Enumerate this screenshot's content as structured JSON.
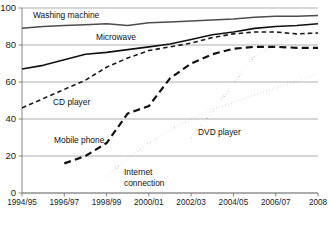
{
  "chart_data": {
    "type": "line",
    "title": "",
    "xlabel": "",
    "ylabel": "",
    "ylim": [
      0,
      100
    ],
    "yticks": [
      0,
      20,
      40,
      60,
      80,
      100
    ],
    "grid": true,
    "legend": "inline-labels",
    "categories": [
      "1994/95",
      "1995/96",
      "1996/97",
      "1997/98",
      "1998/99",
      "1999/00",
      "2000/01",
      "2001/02",
      "2002/03",
      "2003/04",
      "2004/05",
      "2005/06",
      "2006/07",
      "2007/08",
      "2008"
    ],
    "xticklabels": [
      "1994/95",
      "1996/97",
      "1998/99",
      "2000/01",
      "2002/03",
      "2004/05",
      "2006/07",
      "2008"
    ],
    "series": [
      {
        "name": "Washing machine",
        "style": "solid",
        "color": "#4d4d4d",
        "width": 1.5,
        "label_x": 33,
        "label_y": 16,
        "x": [
          "1994/95",
          "1995/96",
          "1996/97",
          "1997/98",
          "1998/99",
          "1999/00",
          "2000/01",
          "2001/02",
          "2002/03",
          "2003/04",
          "2004/05",
          "2005/06",
          "2006/07",
          "2007/08",
          "2008"
        ],
        "values": [
          89,
          90,
          90.5,
          91,
          91.5,
          90.5,
          92,
          92.5,
          93,
          93.5,
          94,
          95,
          95.5,
          95.5,
          96
        ]
      },
      {
        "name": "Microwave",
        "style": "solid",
        "color": "#111111",
        "width": 1.6,
        "label_x": 96,
        "label_y": 38,
        "x": [
          "1994/95",
          "1995/96",
          "1996/97",
          "1997/98",
          "1998/99",
          "1999/00",
          "2000/01",
          "2001/02",
          "2002/03",
          "2003/04",
          "2004/05",
          "2005/06",
          "2006/07",
          "2007/08",
          "2008"
        ],
        "values": [
          67,
          69,
          72,
          75,
          76,
          77.5,
          79,
          80.5,
          83,
          85.5,
          87,
          89,
          90,
          90.5,
          91.5
        ]
      },
      {
        "name": "CD player",
        "style": "dashed",
        "color": "#1a1a1a",
        "width": 1.6,
        "label_x": 53,
        "label_y": 103,
        "x": [
          "1994/95",
          "1995/96",
          "1996/97",
          "1997/98",
          "1998/99",
          "1999/00",
          "2000/01",
          "2001/02",
          "2002/03",
          "2003/04",
          "2004/05",
          "2005/06",
          "2006/07",
          "2007/08",
          "2008"
        ],
        "values": [
          46,
          51,
          56,
          61,
          68,
          73,
          77,
          79,
          81,
          84,
          86,
          87,
          87,
          86,
          86.5
        ]
      },
      {
        "name": "Mobile phone",
        "style": "longdash",
        "color": "#111111",
        "width": 2.2,
        "label_x": 54,
        "label_y": 141,
        "x": [
          "1996/97",
          "1997/98",
          "1998/99",
          "1999/00",
          "2000/01",
          "2001/02",
          "2002/03",
          "2003/04",
          "2004/05",
          "2005/06",
          "2006/07",
          "2007/08",
          "2008"
        ],
        "values": [
          16,
          20,
          27,
          43,
          47,
          62,
          70,
          75,
          78,
          79,
          79,
          78.5,
          78.5
        ]
      },
      {
        "name": "Internet connection",
        "style": "dotted",
        "color": "#1a1a1a",
        "width": 2.0,
        "label_x": 124,
        "label_y": 173,
        "label_x2": 124,
        "label_y2": 184,
        "label_line1": "Internet",
        "label_line2": "connection",
        "x": [
          "1998/99",
          "1999/00",
          "2000/01",
          "2001/02",
          "2002/03",
          "2003/04",
          "2004/05",
          "2005/06",
          "2006/07",
          "2007/08",
          "2008"
        ],
        "values": [
          9,
          19,
          27,
          34,
          40,
          45,
          49,
          53,
          57,
          60,
          65
        ]
      },
      {
        "name": "DVD player",
        "style": "dotted",
        "color": "#1a1a1a",
        "width": 2.0,
        "label_x": 198,
        "label_y": 133,
        "x": [
          "2002/03",
          "2003/04",
          "2004/05",
          "2005/06",
          "2006/07",
          "2007/08",
          "2008"
        ],
        "values": [
          30,
          44,
          59,
          74,
          80,
          85,
          87
        ]
      }
    ]
  }
}
